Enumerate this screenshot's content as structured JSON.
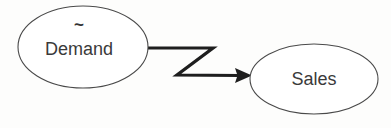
{
  "diagram": {
    "type": "causal-loop-diagram",
    "background_color": "#fdfdfc",
    "nodes": [
      {
        "id": "demand",
        "label": "Demand",
        "marker": "~",
        "marker_meaning": "stochastic-variable-tilde",
        "shape": "ellipse",
        "cx": 83,
        "cy": 47,
        "rx": 65,
        "ry": 41,
        "fill_color": "#ffffff",
        "stroke_color": "#4a4a4a",
        "label_color": "#3a3a3a"
      },
      {
        "id": "sales",
        "label": "Sales",
        "marker": "",
        "shape": "ellipse",
        "cx": 314,
        "cy": 79,
        "rx": 64,
        "ry": 35,
        "fill_color": "#ffffff",
        "stroke_color": "#4a4a4a",
        "label_color": "#3a3a3a"
      }
    ],
    "edges": [
      {
        "id": "demand-to-sales",
        "from": "demand",
        "to": "sales",
        "style": "zigzag-polyline",
        "arrowhead": "solid-triangle",
        "color": "#1e1e1e",
        "stroke_width": 3.2,
        "points": "148,48 213,48 177,75 240,75.5",
        "arrow_tip_x": 252,
        "arrow_tip_y": 75.5
      }
    ]
  }
}
